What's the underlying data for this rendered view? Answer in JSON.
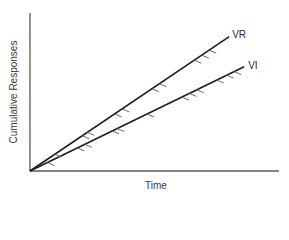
{
  "chart_data": {
    "type": "line",
    "title": "",
    "xlabel": "Time",
    "ylabel": "Cumulative Responses",
    "grid": false,
    "legend": "inline labels at line ends",
    "axis_ticks": "none",
    "series": [
      {
        "name": "VR",
        "description": "Variable-ratio schedule: steeper cumulative response rate",
        "start": [
          0,
          0
        ],
        "end": [
          0.8,
          0.85
        ],
        "slope_relative": "steeper",
        "reinforcement_marks_x": [
          0.1,
          0.21,
          0.23,
          0.34,
          0.37,
          0.49,
          0.52,
          0.66,
          0.69,
          0.72
        ]
      },
      {
        "name": "VI",
        "description": "Variable-interval schedule: shallower cumulative response rate",
        "start": [
          0,
          0
        ],
        "end": [
          0.86,
          0.66
        ],
        "slope_relative": "shallower",
        "reinforcement_marks_x": [
          0.07,
          0.19,
          0.22,
          0.33,
          0.35,
          0.47,
          0.61,
          0.64,
          0.67,
          0.75,
          0.79,
          0.82
        ]
      }
    ]
  },
  "labels": {
    "x_axis": "Time",
    "y_axis": "Cumulative Responses",
    "series_vr": "VR",
    "series_vi": "VI"
  },
  "colors": {
    "axis": "#5a5a5a",
    "line": "#1e1e1e",
    "tick": "#6a6a6a",
    "text": "#3a3a3a"
  }
}
